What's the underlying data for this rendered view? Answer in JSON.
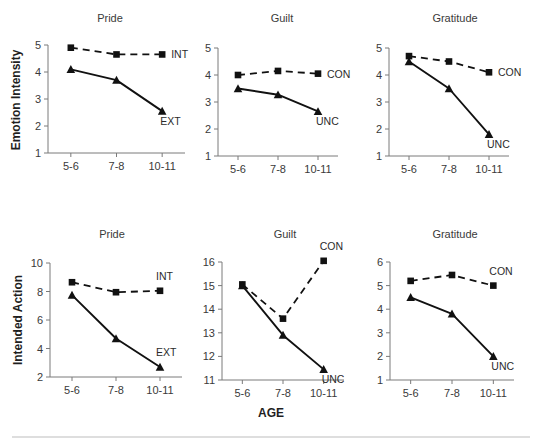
{
  "figure": {
    "width": 542,
    "height": 445,
    "background": "#ffffff",
    "line_color": "#111111",
    "axis_color": "#7a7a7a",
    "rule_color": "#bdbdbd",
    "x_axis_title": "AGE",
    "row_labels": [
      "Emotion Intensity",
      "Intended Action"
    ]
  },
  "chart_data": [
    {
      "type": "line",
      "title": "Pride",
      "row": "Emotion Intensity",
      "xlabel": "AGE",
      "ylabel": "Emotion Intensity",
      "categories": [
        "5-6",
        "7-8",
        "10-11"
      ],
      "ylim": [
        1,
        5
      ],
      "yticks": [
        1,
        2,
        3,
        4,
        5
      ],
      "grid": false,
      "legend_position": "inline-right",
      "series": [
        {
          "name": "INT",
          "style": "dashed",
          "marker": "square",
          "values": [
            4.9,
            4.65,
            4.65
          ],
          "label_anchor": "end"
        },
        {
          "name": "EXT",
          "style": "solid",
          "marker": "triangle",
          "values": [
            4.1,
            3.7,
            2.55
          ],
          "label_anchor": "end"
        }
      ]
    },
    {
      "type": "line",
      "title": "Guilt",
      "row": "Emotion Intensity",
      "xlabel": "AGE",
      "ylabel": "Emotion Intensity",
      "categories": [
        "5-6",
        "7-8",
        "10-11"
      ],
      "ylim": [
        1,
        5
      ],
      "yticks": [
        1,
        2,
        3,
        4,
        5
      ],
      "grid": false,
      "legend_position": "inline-right",
      "series": [
        {
          "name": "CON",
          "style": "dashed",
          "marker": "square",
          "values": [
            4.0,
            4.15,
            4.05
          ],
          "label_anchor": "end"
        },
        {
          "name": "UNC",
          "style": "solid",
          "marker": "triangle",
          "values": [
            3.5,
            3.27,
            2.65
          ],
          "label_anchor": "end"
        }
      ]
    },
    {
      "type": "line",
      "title": "Gratitude",
      "row": "Emotion Intensity",
      "xlabel": "AGE",
      "ylabel": "Emotion Intensity",
      "categories": [
        "5-6",
        "7-8",
        "10-11"
      ],
      "ylim": [
        1,
        5
      ],
      "yticks": [
        1,
        2,
        3,
        4,
        5
      ],
      "grid": false,
      "legend_position": "inline-right",
      "series": [
        {
          "name": "CON",
          "style": "dashed",
          "marker": "square",
          "values": [
            4.7,
            4.5,
            4.1
          ],
          "label_anchor": "end"
        },
        {
          "name": "UNC",
          "style": "solid",
          "marker": "triangle",
          "values": [
            4.5,
            3.5,
            1.8
          ],
          "label_anchor": "end"
        }
      ]
    },
    {
      "type": "line",
      "title": "Pride",
      "row": "Intended Action",
      "xlabel": "AGE",
      "ylabel": "Intended Action",
      "categories": [
        "5-6",
        "7-8",
        "10-11"
      ],
      "ylim": [
        2,
        10
      ],
      "yticks": [
        2,
        4,
        6,
        8,
        10
      ],
      "grid": false,
      "legend_position": "inline-right",
      "series": [
        {
          "name": "INT",
          "style": "dashed",
          "marker": "square",
          "values": [
            8.65,
            7.95,
            8.05
          ],
          "label_anchor": "above"
        },
        {
          "name": "EXT",
          "style": "solid",
          "marker": "triangle",
          "values": [
            7.75,
            4.7,
            2.7
          ],
          "label_anchor": "above"
        }
      ]
    },
    {
      "type": "line",
      "title": "Guilt",
      "row": "Intended Action",
      "xlabel": "AGE",
      "ylabel": "Intended Action",
      "categories": [
        "5-6",
        "7-8",
        "10-11"
      ],
      "ylim": [
        11,
        16
      ],
      "yticks": [
        11,
        12,
        13,
        14,
        15,
        16
      ],
      "grid": false,
      "legend_position": "inline-right",
      "series": [
        {
          "name": "CON",
          "style": "dashed",
          "marker": "square",
          "values": [
            15.05,
            13.6,
            16.05
          ],
          "label_anchor": "above"
        },
        {
          "name": "UNC",
          "style": "solid",
          "marker": "triangle",
          "values": [
            15.0,
            12.9,
            11.45
          ],
          "label_anchor": "end"
        }
      ]
    },
    {
      "type": "line",
      "title": "Gratitude",
      "row": "Intended Action",
      "xlabel": "AGE",
      "ylabel": "Intended Action",
      "categories": [
        "5-6",
        "7-8",
        "10-11"
      ],
      "ylim": [
        1,
        6
      ],
      "yticks": [
        1,
        2,
        3,
        4,
        5,
        6
      ],
      "grid": false,
      "legend_position": "inline-right",
      "series": [
        {
          "name": "CON",
          "style": "dashed",
          "marker": "square",
          "values": [
            5.2,
            5.45,
            5.0
          ],
          "label_anchor": "above"
        },
        {
          "name": "UNC",
          "style": "solid",
          "marker": "triangle",
          "values": [
            4.5,
            3.8,
            2.0
          ],
          "label_anchor": "end"
        }
      ]
    }
  ],
  "layout": {
    "panels": [
      {
        "x": 48,
        "y": 45,
        "w": 137,
        "h": 108,
        "title_x": 110,
        "title_y": 22
      },
      {
        "x": 218,
        "y": 48,
        "w": 120,
        "h": 108,
        "title_x": 282,
        "title_y": 22
      },
      {
        "x": 389,
        "y": 48,
        "w": 120,
        "h": 108,
        "title_x": 455,
        "title_y": 22
      },
      {
        "x": 50,
        "y": 263,
        "w": 132,
        "h": 114,
        "title_x": 112,
        "title_y": 238
      },
      {
        "x": 222,
        "y": 262,
        "w": 122,
        "h": 118,
        "title_x": 285,
        "title_y": 238
      },
      {
        "x": 390,
        "y": 262,
        "w": 124,
        "h": 118,
        "title_x": 455,
        "title_y": 238
      }
    ],
    "row_label_positions": [
      {
        "x": 20,
        "y": 100
      },
      {
        "x": 22,
        "y": 320
      }
    ],
    "x_axis_title_pos": {
      "x": 271,
      "y": 417
    },
    "bottom_rule": {
      "x1": 12,
      "x2": 530,
      "y": 437
    }
  }
}
